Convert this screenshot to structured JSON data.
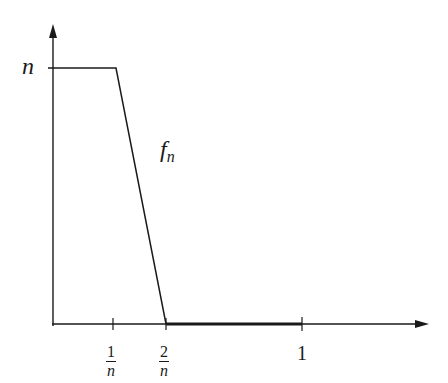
{
  "diagram": {
    "type": "function-graph",
    "function_label": "f",
    "function_subscript": "n",
    "y_axis_label": "n",
    "x_ticks": [
      {
        "numerator": "1",
        "denominator": "n"
      },
      {
        "numerator": "2",
        "denominator": "n"
      },
      {
        "value": "1"
      }
    ],
    "colors": {
      "line": "#1a1a1a",
      "background": "#ffffff"
    }
  }
}
